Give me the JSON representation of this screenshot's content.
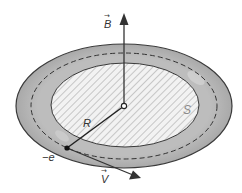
{
  "diagram": {
    "labels": {
      "magnetic_field": "B",
      "radius": "R",
      "area": "S",
      "charge": "−e",
      "velocity": "V"
    },
    "vector_marker": "→",
    "colors": {
      "ring_fill": "#b8b8b8",
      "ring_stroke": "#3a3a3a",
      "inner_fill": "#f2f2f2",
      "hatch": "#a8a8a8",
      "lines": "#333333",
      "area_label": "#8a8a8a"
    }
  }
}
